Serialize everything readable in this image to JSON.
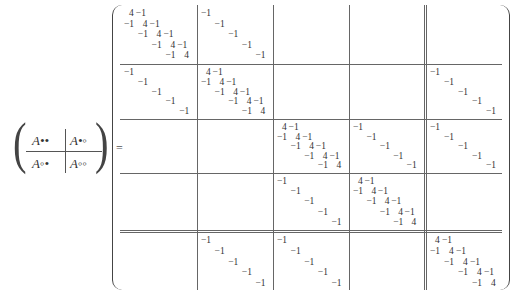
{
  "lhs": {
    "cells": [
      {
        "label": "A••"
      },
      {
        "label": "A•◦"
      },
      {
        "label": "A◦•"
      },
      {
        "label": "A◦◦"
      }
    ]
  },
  "equals": "=",
  "matrix": {
    "block_size": 5,
    "tridiag_block": {
      "diagonal": "4",
      "offdiagonal": "−1"
    },
    "identity_block": {
      "diagonal": "−1"
    },
    "block_pattern": [
      [
        "T",
        "-I",
        "0",
        "0",
        "0"
      ],
      [
        "-I",
        "T",
        "0",
        "0",
        "-I"
      ],
      [
        "0",
        "0",
        "T",
        "-I",
        "-I"
      ],
      [
        "0",
        "0",
        "-I",
        "T",
        "0"
      ],
      [
        "0",
        "-I",
        "-I",
        "0",
        "T"
      ]
    ],
    "double_divider_after_block": 4
  }
}
